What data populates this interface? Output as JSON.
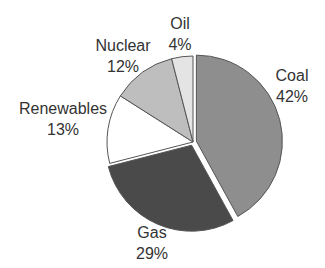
{
  "chart_data": {
    "type": "pie",
    "title": "",
    "start_angle": "12 o'clock, clockwise",
    "slices": [
      {
        "label": "Coal",
        "value": 42,
        "pct_label": "42%",
        "color": "#8e8e8e",
        "exploded": true
      },
      {
        "label": "Gas",
        "value": 29,
        "pct_label": "29%",
        "color": "#4a4a4a",
        "exploded": true
      },
      {
        "label": "Renewables",
        "value": 13,
        "pct_label": "13%",
        "color": "#ffffff",
        "exploded": false
      },
      {
        "label": "Nuclear",
        "value": 12,
        "pct_label": "12%",
        "color": "#bebebe",
        "exploded": false
      },
      {
        "label": "Oil",
        "value": 4,
        "pct_label": "4%",
        "color": "#e4e4e4",
        "exploded": false
      }
    ],
    "legend": "none (direct labels)"
  },
  "labels": {
    "coal": {
      "name": "Coal",
      "pct": "42%"
    },
    "gas": {
      "name": "Gas",
      "pct": "29%"
    },
    "renewables": {
      "name": "Renewables",
      "pct": "13%"
    },
    "nuclear": {
      "name": "Nuclear",
      "pct": "12%"
    },
    "oil": {
      "name": "Oil",
      "pct": "4%"
    }
  }
}
